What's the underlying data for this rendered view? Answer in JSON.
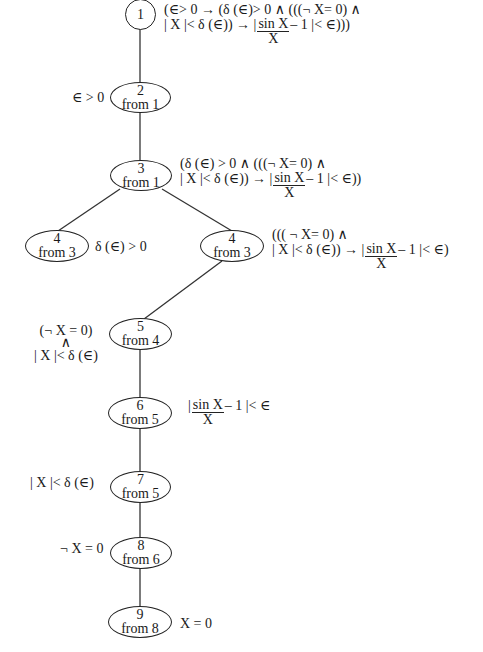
{
  "diagram": {
    "type": "proof-tree",
    "nodes": [
      {
        "id": "1",
        "num": "1",
        "from": "",
        "formula_line1": "(∈> 0 →  (δ (∈)> 0 ∧ (((¬ X= 0) ∧",
        "formula_line2_pre": "| X |< δ (∈)) → |",
        "frac_num": "sin X",
        "frac_den": "X",
        "formula_line2_post": "– 1 |< ∈)))"
      },
      {
        "id": "2",
        "num": "2",
        "from": "from 1",
        "formula": "∈ > 0"
      },
      {
        "id": "3",
        "num": "3",
        "from": "from 1",
        "formula_line1": "(δ (∈) > 0 ∧  (((¬ X= 0) ∧",
        "formula_line2_pre": "| X |< δ (∈)) → |",
        "frac_num": "sin X",
        "frac_den": "X",
        "formula_line2_post": "– 1 |< ∈))"
      },
      {
        "id": "4a",
        "num": "4",
        "from": "from 3",
        "formula": "δ (∈) > 0"
      },
      {
        "id": "4b",
        "num": "4",
        "from": "from 3",
        "formula_line1": "((( ¬ X= 0) ∧",
        "formula_line2_pre": "| X |< δ (∈)) → |",
        "frac_num": "sin X",
        "frac_den": "X",
        "formula_line2_post": "– 1 |< ∈)"
      },
      {
        "id": "5",
        "num": "5",
        "from": "from 4",
        "formula_line1": "(¬ X = 0)",
        "formula_line2": "∧",
        "formula_line3": "| X |< δ (∈)"
      },
      {
        "id": "6",
        "num": "6",
        "from": "from 5",
        "formula_pre": "|",
        "frac_num": "sin X",
        "frac_den": "X",
        "formula_post": "– 1 |< ∈"
      },
      {
        "id": "7",
        "num": "7",
        "from": "from 5",
        "formula": "| X |< δ (∈)"
      },
      {
        "id": "8",
        "num": "8",
        "from": "from 6",
        "formula": "¬ X = 0"
      },
      {
        "id": "9",
        "num": "9",
        "from": "from 8",
        "formula": "X = 0"
      }
    ],
    "edges": [
      [
        "1",
        "2"
      ],
      [
        "2",
        "3"
      ],
      [
        "3",
        "4a"
      ],
      [
        "3",
        "4b"
      ],
      [
        "4b",
        "5"
      ],
      [
        "5",
        "6"
      ],
      [
        "6",
        "7"
      ],
      [
        "7",
        "8"
      ],
      [
        "8",
        "9"
      ]
    ]
  }
}
